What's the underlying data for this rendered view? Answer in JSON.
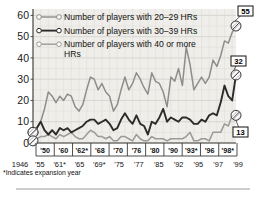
{
  "legend": {
    "position": "top-left-inside",
    "items": [
      {
        "label": "Number of players with 20–29 HRs",
        "color": "#8d8d8d",
        "key": "hr20_29"
      },
      {
        "label": "Number of players with 30–39 HRs",
        "color": "#2b2b2b",
        "key": "hr30_39"
      },
      {
        "label": "Number of players with 40 or more HRs",
        "color": "#9a9a9a",
        "key": "hr40plus"
      }
    ]
  },
  "footnote": "*Indicates expansion year",
  "axis": {
    "y_ticks": [
      "60",
      "50",
      "40",
      "30",
      "20",
      "10",
      "0"
    ],
    "x_labels_top": [
      "'50",
      "'60",
      "'62*",
      "'68",
      "'70",
      "'76",
      "'80",
      "'90",
      "'93*",
      "'96",
      "'98*"
    ],
    "x_labels_bottom": [
      "1946",
      "'55",
      "'61*",
      "'65",
      "'69*",
      "'75",
      "'77",
      "'85",
      "'92",
      "'95",
      "'97",
      "'99"
    ]
  },
  "end_labels": [
    {
      "value": "55",
      "series": "hr20_29"
    },
    {
      "value": "32",
      "series": "hr30_39"
    },
    {
      "value": "13",
      "series": "hr40plus"
    }
  ],
  "chart_data": {
    "type": "line",
    "title": "",
    "subtitle": "",
    "xlabel": "",
    "ylabel": "",
    "ylim": [
      0,
      63
    ],
    "grid": true,
    "legend_position": "top-left-inside",
    "x": [
      1946,
      1947,
      1948,
      1949,
      1950,
      1951,
      1952,
      1953,
      1954,
      1955,
      1956,
      1957,
      1958,
      1959,
      1960,
      1961,
      1962,
      1963,
      1964,
      1965,
      1966,
      1967,
      1968,
      1969,
      1970,
      1971,
      1972,
      1973,
      1974,
      1975,
      1976,
      1977,
      1978,
      1979,
      1980,
      1981,
      1982,
      1983,
      1984,
      1985,
      1986,
      1987,
      1988,
      1989,
      1990,
      1991,
      1992,
      1993,
      1994,
      1995,
      1996,
      1997,
      1998,
      1999
    ],
    "series": [
      {
        "name": "Number of players with 20-29 HRs",
        "key": "hr20_29",
        "color": "#8d8d8d",
        "end_label": "55",
        "values": [
          5,
          7,
          10,
          16,
          24,
          22,
          19,
          22,
          20,
          23,
          22,
          17,
          15,
          18,
          25,
          31,
          30,
          25,
          28,
          24,
          22,
          15,
          18,
          25,
          31,
          25,
          28,
          33,
          30,
          26,
          23,
          33,
          29,
          28,
          24,
          17,
          31,
          29,
          35,
          27,
          45,
          37,
          25,
          28,
          31,
          28,
          31,
          39,
          36,
          41,
          48,
          47,
          52,
          55
        ]
      },
      {
        "name": "Number of players with 30-39 HRs",
        "key": "hr30_39",
        "color": "#2b2b2b",
        "end_label": "32",
        "values": [
          5,
          7,
          10,
          6,
          4,
          6,
          4,
          7,
          6,
          7,
          5,
          6,
          7,
          8,
          10,
          11,
          11,
          9,
          10,
          11,
          9,
          6,
          7,
          11,
          14,
          11,
          9,
          13,
          9,
          8,
          4,
          10,
          9,
          12,
          16,
          10,
          12,
          11,
          10,
          12,
          12,
          11,
          9,
          9,
          11,
          10,
          13,
          14,
          13,
          19,
          27,
          22,
          20,
          32
        ]
      },
      {
        "name": "Number of players with 40 or more HRs",
        "key": "hr40plus",
        "color": "#9a9a9a",
        "end_label": "13",
        "values": [
          1,
          2,
          3,
          3,
          4,
          3,
          2,
          4,
          3,
          4,
          5,
          3,
          2,
          2,
          4,
          6,
          5,
          3,
          3,
          2,
          3,
          1,
          1,
          3,
          3,
          2,
          1,
          4,
          2,
          1,
          1,
          3,
          2,
          2,
          2,
          1,
          2,
          2,
          2,
          2,
          3,
          5,
          1,
          1,
          2,
          2,
          1,
          5,
          5,
          5,
          9,
          8,
          13,
          13
        ]
      }
    ]
  }
}
